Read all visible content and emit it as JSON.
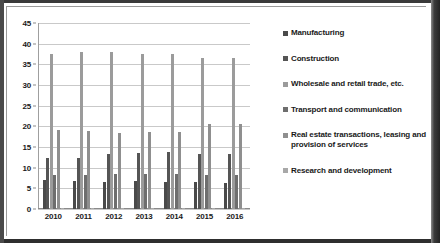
{
  "chart_data": {
    "type": "bar",
    "title": "",
    "xlabel": "",
    "ylabel": "",
    "ylim": [
      0,
      45
    ],
    "ytick_step": 5,
    "yticks": [
      0,
      5,
      10,
      15,
      20,
      25,
      30,
      35,
      40,
      45
    ],
    "grid": true,
    "legend_position": "right",
    "categories": [
      "2010",
      "2011",
      "2012",
      "2013",
      "2014",
      "2015",
      "2016"
    ],
    "series": [
      {
        "name": "Manufacturing",
        "color": "#4a4a4a",
        "values": [
          7.0,
          6.7,
          6.5,
          6.7,
          6.6,
          6.5,
          6.4
        ]
      },
      {
        "name": "Construction",
        "color": "#555555",
        "values": [
          12.3,
          12.3,
          13.3,
          13.6,
          13.9,
          13.3,
          13.2
        ]
      },
      {
        "name": "Wholesale and retail trade, etc.",
        "color": "#9b9b9b",
        "values": [
          37.4,
          38.1,
          38.1,
          37.4,
          37.4,
          36.6,
          36.6
        ]
      },
      {
        "name": "Transport and communication",
        "color": "#6e6e6e",
        "values": [
          8.3,
          8.2,
          8.4,
          8.4,
          8.4,
          8.2,
          8.3
        ]
      },
      {
        "name": "Real estate transactions, leasing and provision of services",
        "color": "#8f8f8f",
        "values": [
          19.1,
          18.9,
          18.5,
          18.7,
          18.6,
          20.6,
          20.5
        ]
      },
      {
        "name": "Research and development",
        "color": "#a8a8a8",
        "values": [
          0.3,
          0.3,
          0.3,
          0.3,
          0.3,
          0.3,
          0.3
        ]
      }
    ]
  },
  "legend": {
    "items": [
      {
        "label": "Manufacturing",
        "swatch": "#4a4a4a"
      },
      {
        "label": "Construction",
        "swatch": "#555555"
      },
      {
        "label": "Wholesale and retail trade, etc.",
        "swatch": "#9b9b9b"
      },
      {
        "label": "Transport and communication",
        "swatch": "#6e6e6e"
      },
      {
        "label": "Real estate transactions, leasing and provision of services",
        "swatch": "#8f8f8f"
      },
      {
        "label": "Research and development",
        "swatch": "#a8a8a8"
      }
    ]
  }
}
